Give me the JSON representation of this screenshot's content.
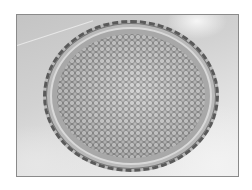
{
  "image": {
    "subject": "tart pan filled with dried beans (pie weights)",
    "style": "grayscale photograph",
    "colors": {
      "page_background": "#ffffff",
      "photo_border": "#8a8a8a",
      "surface_light": "#eeeeee",
      "surface_dark": "#c4c4c4",
      "pan_edge": "#5a5a5a",
      "beans_light": "#cfcfcf",
      "beans_dark": "#7e7e7e"
    }
  }
}
